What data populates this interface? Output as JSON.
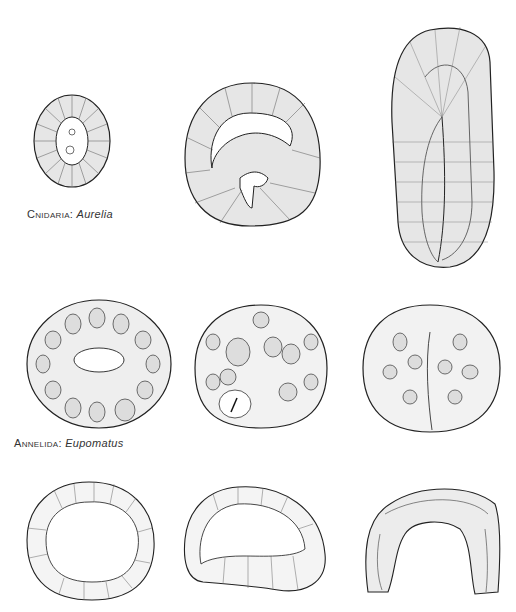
{
  "figure": {
    "rows": [
      {
        "label": {
          "phylum": "Cnidaria",
          "separator": ": ",
          "genus": "Aurelia"
        },
        "stages": [
          "blastula",
          "early gastrula (invagination)",
          "late gastrula"
        ]
      },
      {
        "label": {
          "phylum": "Annelida",
          "separator": ": ",
          "genus": "Eupomatus"
        },
        "stages": [
          "blastula",
          "early gastrula",
          "late gastrula"
        ]
      },
      {
        "label": {
          "phylum": "",
          "separator": "",
          "genus": ""
        },
        "stages": [
          "blastula",
          "early gastrula",
          "late gastrula"
        ]
      }
    ],
    "colors": {
      "ink": "#222222",
      "fill": "#e6e6e6",
      "background": "#ffffff"
    }
  }
}
